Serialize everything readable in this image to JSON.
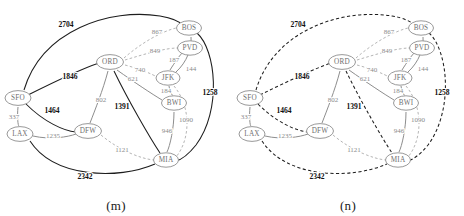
{
  "figure": {
    "panels": [
      {
        "id": "m",
        "caption": "(m)",
        "highlight_style": "solid-bold"
      },
      {
        "id": "n",
        "caption": "(n)",
        "highlight_style": "dashed-bold"
      }
    ]
  },
  "graph": {
    "nodes": [
      {
        "id": "SFO",
        "label": "SFO",
        "x": 18,
        "y": 98
      },
      {
        "id": "LAX",
        "label": "LAX",
        "x": 20,
        "y": 134
      },
      {
        "id": "ORD",
        "label": "ORD",
        "x": 110,
        "y": 62
      },
      {
        "id": "DFW",
        "label": "DFW",
        "x": 88,
        "y": 131
      },
      {
        "id": "MIA",
        "label": "MIA",
        "x": 166,
        "y": 160
      },
      {
        "id": "JFK",
        "label": "JFK",
        "x": 168,
        "y": 78
      },
      {
        "id": "BWI",
        "label": "BWI",
        "x": 174,
        "y": 103
      },
      {
        "id": "PVD",
        "label": "PVD",
        "x": 190,
        "y": 48
      },
      {
        "id": "BOS",
        "label": "BOS",
        "x": 189,
        "y": 28
      }
    ],
    "edges": [
      {
        "id": "SFO-BOS",
        "from": "SFO",
        "to": "BOS",
        "weight": "2704",
        "emphasis": "bold",
        "label_x": 66,
        "label_y": 24
      },
      {
        "id": "SFO-ORD",
        "from": "SFO",
        "to": "ORD",
        "weight": "1846",
        "emphasis": "bold",
        "label_x": 70,
        "label_y": 76
      },
      {
        "id": "SFO-DFW",
        "from": "SFO",
        "to": "DFW",
        "weight": "1464",
        "emphasis": "bold",
        "label_x": 52,
        "label_y": 110
      },
      {
        "id": "ORD-MIA",
        "from": "ORD",
        "to": "MIA",
        "weight": "1391",
        "emphasis": "bold",
        "label_x": 122,
        "label_y": 106
      },
      {
        "id": "LAX-MIA",
        "from": "LAX",
        "to": "MIA",
        "weight": "2342",
        "emphasis": "bold",
        "label_x": 85,
        "label_y": 176
      },
      {
        "id": "BOS-MIA",
        "from": "BOS",
        "to": "MIA",
        "weight": "1258",
        "emphasis": "bold",
        "label_x": 210,
        "label_y": 92
      },
      {
        "id": "SFO-LAX",
        "from": "SFO",
        "to": "LAX",
        "weight": "337",
        "emphasis": "thin-solid",
        "label_x": 14,
        "label_y": 117
      },
      {
        "id": "LAX-DFW",
        "from": "LAX",
        "to": "DFW",
        "weight": "1235",
        "emphasis": "thin-solid",
        "label_x": 53,
        "label_y": 136
      },
      {
        "id": "ORD-DFW",
        "from": "ORD",
        "to": "DFW",
        "weight": "802",
        "emphasis": "thin-solid",
        "label_x": 101,
        "label_y": 100
      },
      {
        "id": "ORD-JFK",
        "from": "ORD",
        "to": "JFK",
        "weight": "740",
        "emphasis": "thin-dash",
        "label_x": 140,
        "label_y": 70
      },
      {
        "id": "ORD-BWI",
        "from": "ORD",
        "to": "BWI",
        "weight": "621",
        "emphasis": "thin-solid",
        "label_x": 133,
        "label_y": 79
      },
      {
        "id": "ORD-PVD",
        "from": "ORD",
        "to": "PVD",
        "weight": "849",
        "emphasis": "thin-dash",
        "label_x": 155,
        "label_y": 51
      },
      {
        "id": "ORD-BOS",
        "from": "ORD",
        "to": "BOS",
        "weight": "867",
        "emphasis": "thin-dash",
        "label_x": 157,
        "label_y": 32
      },
      {
        "id": "JFK-PVD",
        "from": "JFK",
        "to": "PVD",
        "weight": "187",
        "emphasis": "thin-solid",
        "label_x": 174,
        "label_y": 60
      },
      {
        "id": "JFK-BOS",
        "from": "JFK",
        "to": "BOS",
        "weight": "144",
        "emphasis": "thin-solid",
        "label_x": 191,
        "label_y": 69
      },
      {
        "id": "JFK-BWI",
        "from": "JFK",
        "to": "BWI",
        "weight": "184",
        "emphasis": "thin-solid",
        "label_x": 166,
        "label_y": 91
      },
      {
        "id": "JFK-MIA",
        "from": "JFK",
        "to": "MIA",
        "weight": "1090",
        "emphasis": "thin-dash",
        "label_x": 186,
        "label_y": 120
      },
      {
        "id": "BWI-MIA",
        "from": "BWI",
        "to": "MIA",
        "weight": "946",
        "emphasis": "thin-solid",
        "label_x": 167,
        "label_y": 131
      },
      {
        "id": "DFW-MIA",
        "from": "DFW",
        "to": "MIA",
        "weight": "1121",
        "emphasis": "thin-dash",
        "label_x": 122,
        "label_y": 150
      }
    ]
  },
  "colors": {
    "bold_edge": "#1d1d1d",
    "thin_edge": "#8d8d8d",
    "thin_dash_edge": "#a8a8a8",
    "node_stroke": "#8d8d8d",
    "node_fill": "#ffffff",
    "node_text": "#6f6f6f",
    "bold_label": "#111111",
    "thin_label": "#8a8a8a",
    "background": "#ffffff"
  }
}
